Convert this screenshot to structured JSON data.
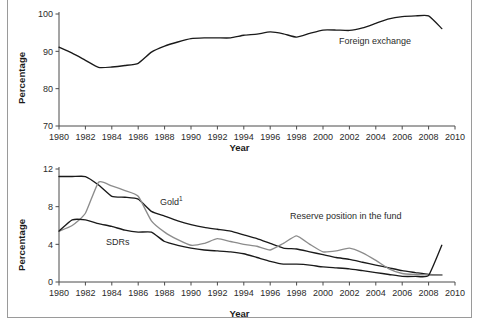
{
  "figure": {
    "axis_label_x": "Year",
    "axis_label_y": "Percentage",
    "line_color_black": "#1a1a1a",
    "line_color_gray": "#8c8c8c",
    "frame_color": "#9a9a9a"
  },
  "top": {
    "series_label": "Foreign exchange",
    "yticks": [
      "70",
      "80",
      "90",
      "100"
    ],
    "xticks": [
      "1980",
      "1982",
      "1984",
      "1986",
      "1988",
      "1990",
      "1992",
      "1994",
      "1996",
      "1998",
      "2000",
      "2002",
      "2004",
      "2006",
      "2008",
      "2010"
    ]
  },
  "bottom": {
    "label_gold": "Gold",
    "label_gold_sup": "1",
    "label_sdrs": "SDRs",
    "label_reserve": "Reserve position in the fund",
    "yticks": [
      "0",
      "4",
      "8",
      "12"
    ],
    "xticks": [
      "1980",
      "1982",
      "1984",
      "1986",
      "1988",
      "1990",
      "1992",
      "1994",
      "1996",
      "1998",
      "2000",
      "2002",
      "2004",
      "2006",
      "2008",
      "2010"
    ]
  },
  "chart_data": [
    {
      "type": "line",
      "title": "",
      "xlabel": "Year",
      "ylabel": "Percentage",
      "xlim": [
        1980,
        2010
      ],
      "ylim": [
        70,
        100
      ],
      "yticks": [
        70,
        80,
        90,
        100
      ],
      "xticks": [
        1980,
        1982,
        1984,
        1986,
        1988,
        1990,
        1992,
        1994,
        1996,
        1998,
        2000,
        2002,
        2004,
        2006,
        2008,
        2010
      ],
      "grid": false,
      "legend": "inline-annotation",
      "x": [
        1980,
        1981,
        1982,
        1983,
        1984,
        1985,
        1986,
        1987,
        1988,
        1989,
        1990,
        1991,
        1992,
        1993,
        1994,
        1995,
        1996,
        1997,
        1998,
        1999,
        2000,
        2001,
        2002,
        2003,
        2004,
        2005,
        2006,
        2007,
        2008,
        2009
      ],
      "series": [
        {
          "name": "Foreign exchange",
          "color": "#1a1a1a",
          "values": [
            91.1,
            89.5,
            87.6,
            85.7,
            85.8,
            86.2,
            86.8,
            89.8,
            91.4,
            92.5,
            93.4,
            93.6,
            93.6,
            93.6,
            94.3,
            94.6,
            95.2,
            94.7,
            93.8,
            94.8,
            95.7,
            95.7,
            95.6,
            96.3,
            97.5,
            98.7,
            99.3,
            99.5,
            99.5,
            96.1
          ]
        }
      ]
    },
    {
      "type": "line",
      "title": "",
      "xlabel": "Year",
      "ylabel": "Percentage",
      "xlim": [
        1980,
        2010
      ],
      "ylim": [
        0,
        12
      ],
      "yticks": [
        0,
        4,
        8,
        12
      ],
      "xticks": [
        1980,
        1982,
        1984,
        1986,
        1988,
        1990,
        1992,
        1994,
        1996,
        1998,
        2000,
        2002,
        2004,
        2006,
        2008,
        2010
      ],
      "grid": false,
      "legend": "inline-annotation",
      "x": [
        1980,
        1981,
        1982,
        1983,
        1984,
        1985,
        1986,
        1987,
        1988,
        1989,
        1990,
        1991,
        1992,
        1993,
        1994,
        1995,
        1996,
        1997,
        1998,
        1999,
        2000,
        2001,
        2002,
        2003,
        2004,
        2005,
        2006,
        2007,
        2008,
        2009
      ],
      "series": [
        {
          "name": "Gold",
          "color": "#1a1a1a",
          "values": [
            11.2,
            11.2,
            11.2,
            10.3,
            9.1,
            9.0,
            8.8,
            7.5,
            7.0,
            6.5,
            6.1,
            5.8,
            5.6,
            5.4,
            5.0,
            4.6,
            4.1,
            3.6,
            3.5,
            3.2,
            2.9,
            2.6,
            2.4,
            2.1,
            1.8,
            1.5,
            1.2,
            1.0,
            0.8,
            0.75
          ]
        },
        {
          "name": "Reserve position in the fund",
          "color": "#8c8c8c",
          "values": [
            5.4,
            6.0,
            7.3,
            10.6,
            10.2,
            9.7,
            9.1,
            6.5,
            5.3,
            4.5,
            3.9,
            4.1,
            4.6,
            4.3,
            4.0,
            3.8,
            3.4,
            4.1,
            4.9,
            4.0,
            3.2,
            3.3,
            3.6,
            3.1,
            2.3,
            1.4,
            0.9,
            0.8,
            0.75,
            0.75
          ]
        },
        {
          "name": "SDRs",
          "color": "#1a1a1a",
          "values": [
            5.4,
            6.6,
            6.6,
            6.2,
            5.9,
            5.5,
            5.3,
            5.3,
            4.3,
            3.9,
            3.6,
            3.4,
            3.3,
            3.2,
            3.0,
            2.6,
            2.2,
            1.9,
            1.9,
            1.8,
            1.6,
            1.5,
            1.4,
            1.2,
            1.0,
            0.8,
            0.6,
            0.6,
            0.7,
            3.9
          ]
        }
      ]
    }
  ]
}
